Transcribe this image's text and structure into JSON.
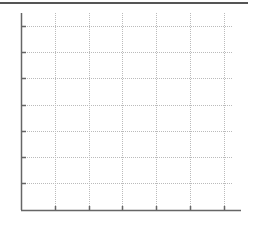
{
  "chart_data": {
    "type": "line",
    "title": "",
    "xlabel": "",
    "ylabel": "",
    "series": [],
    "x_ticks_px": [
      55,
      89,
      122,
      156,
      190,
      224
    ],
    "y_ticks_px": [
      26,
      52,
      78,
      105,
      131,
      157,
      183
    ],
    "x_tick_labels": [],
    "y_tick_labels": [],
    "grid": true,
    "grid_style": "dotted",
    "legend": null
  },
  "colors": {
    "axis": "#666666",
    "grid": "#bbbbbb",
    "top_rule": "#555555"
  }
}
